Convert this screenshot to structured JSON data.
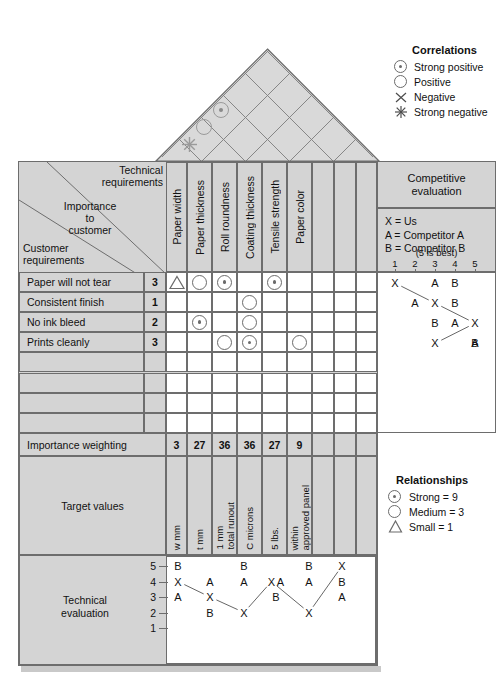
{
  "diagram": {
    "colors": {
      "header_fill": "#d4d4d4",
      "cell_fill": "#ffffff",
      "line": "#6d6d6d",
      "symbol": "#6b6b6b",
      "text": "#111111"
    }
  },
  "correlations_legend": {
    "title": "Correlations",
    "items": [
      {
        "symbol": "strong-positive-icon",
        "label": "Strong positive"
      },
      {
        "symbol": "positive-icon",
        "label": "Positive"
      },
      {
        "symbol": "negative-icon",
        "label": "Negative"
      },
      {
        "symbol": "strong-negative-icon",
        "label": "Strong negative"
      }
    ]
  },
  "relationships_legend": {
    "title": "Relationships",
    "items": [
      {
        "symbol": "strong-icon",
        "label": "Strong = 9"
      },
      {
        "symbol": "medium-icon",
        "label": "Medium = 3"
      },
      {
        "symbol": "small-icon",
        "label": "Small = 1"
      }
    ]
  },
  "roof": {
    "correlations": [
      {
        "col_a": 1,
        "col_b": 2,
        "symbol": "strong-negative",
        "x": 186,
        "y": 143
      },
      {
        "col_a": 2,
        "col_b": 3,
        "symbol": "positive",
        "x": 202,
        "y": 127
      },
      {
        "col_a": 3,
        "col_b": 4,
        "symbol": "strong-positive",
        "x": 218,
        "y": 111
      }
    ]
  },
  "header": {
    "technical_requirements": "Technical\nrequirements",
    "technical_requirements_line1": "Technical",
    "technical_requirements_line2": "requirements",
    "importance_line1": "Importance",
    "importance_line2": "to",
    "importance_line3": "customer",
    "customer_line1": "Customer",
    "customer_line2": "requirements"
  },
  "technical_requirements": [
    "Paper width",
    "Paper thickness",
    "Roll roundness",
    "Coating thickness",
    "Tensile strength",
    "Paper color",
    "",
    "",
    ""
  ],
  "customer_requirements": [
    {
      "label": "Paper will not tear",
      "importance": "3"
    },
    {
      "label": "Consistent finish",
      "importance": "1"
    },
    {
      "label": "No ink bleed",
      "importance": "2"
    },
    {
      "label": "Prints cleanly",
      "importance": "3"
    },
    {
      "label": "",
      "importance": ""
    },
    {
      "label": "",
      "importance": ""
    },
    {
      "label": "",
      "importance": ""
    },
    {
      "label": "",
      "importance": ""
    }
  ],
  "relationship_matrix": [
    [
      "small",
      "medium",
      "strong",
      "",
      "strong",
      "",
      "",
      "",
      ""
    ],
    [
      "",
      "",
      "",
      "medium",
      "",
      "",
      "",
      "",
      ""
    ],
    [
      "",
      "strong",
      "",
      "medium",
      "",
      "",
      "",
      "",
      ""
    ],
    [
      "",
      "",
      "medium",
      "strong",
      "",
      "medium",
      "",
      "",
      ""
    ],
    [
      "",
      "",
      "",
      "",
      "",
      "",
      "",
      "",
      ""
    ],
    [
      "",
      "",
      "",
      "",
      "",
      "",
      "",
      "",
      ""
    ],
    [
      "",
      "",
      "",
      "",
      "",
      "",
      "",
      "",
      ""
    ],
    [
      "",
      "",
      "",
      "",
      "",
      "",
      "",
      "",
      ""
    ]
  ],
  "importance_weighting": {
    "label": "Importance weighting",
    "values": [
      "3",
      "27",
      "36",
      "36",
      "27",
      "9",
      "",
      "",
      ""
    ]
  },
  "target_values": {
    "label": "Target values",
    "values": [
      "w mm",
      "t mm",
      "1 mm\ntotal runout",
      "C microns",
      "5 lbs.",
      "within\napproved panel",
      "",
      "",
      ""
    ],
    "values_lines": [
      [
        "w mm"
      ],
      [
        "t mm"
      ],
      [
        "1 mm",
        "total runout"
      ],
      [
        "C microns"
      ],
      [
        "5 lbs."
      ],
      [
        "within",
        "approved panel"
      ],
      [
        ""
      ],
      [
        ""
      ],
      [
        ""
      ]
    ]
  },
  "competitive_evaluation": {
    "title_line1": "Competitive",
    "title_line2": "evaluation",
    "key": [
      "X = Us",
      "A = Competitor A",
      "B = Competitor B"
    ],
    "scale_note": "(5 is best)",
    "scale_ticks": [
      "1",
      "2",
      "3",
      "4",
      "5"
    ],
    "rows": [
      {
        "requirement": "Paper will not tear",
        "X": 1,
        "A": 3,
        "B": 4
      },
      {
        "requirement": "Consistent finish",
        "X": 3,
        "A": 2,
        "B": 4
      },
      {
        "requirement": "No ink bleed",
        "X": 5,
        "A": 4,
        "B": 3
      },
      {
        "requirement": "Prints cleanly",
        "X": 3,
        "A": 5,
        "B": 5
      }
    ]
  },
  "technical_evaluation": {
    "label_line1": "Technical",
    "label_line2": "evaluation",
    "y_ticks": [
      "5",
      "4",
      "3",
      "2",
      "1"
    ],
    "series": [
      {
        "column": "Paper width",
        "X": 4,
        "A": 3,
        "B": 5
      },
      {
        "column": "Paper thickness",
        "X": 3,
        "A": 4,
        "B": 2
      },
      {
        "column": "Roll roundness",
        "X": 2,
        "A": 4,
        "B": 5
      },
      {
        "column": "Coating thickness",
        "X": 4,
        "A": 4,
        "B": 3
      },
      {
        "column": "Tensile strength",
        "X": 2,
        "A": 4,
        "B": 5
      },
      {
        "column": "Paper color",
        "X": 5,
        "A": 3,
        "B": 4
      }
    ]
  }
}
